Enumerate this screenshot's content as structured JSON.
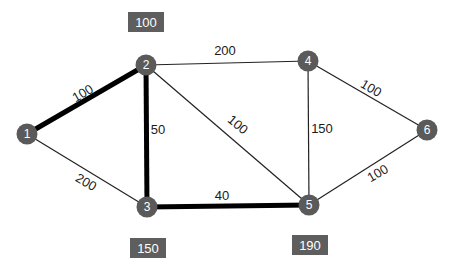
{
  "diagram": {
    "type": "weighted-graph",
    "colors": {
      "node_fill": "#5a5a5a",
      "node_text": "#ffffff",
      "edge_thin": "#222222",
      "edge_thick": "#000000",
      "distance_box": "#5e5e5e",
      "distance_text": "#ffffff",
      "edge_label": "#1a1a1a"
    },
    "nodes": [
      {
        "id": "1",
        "label": "1",
        "x": 27,
        "y": 134
      },
      {
        "id": "2",
        "label": "2",
        "x": 146,
        "y": 65
      },
      {
        "id": "3",
        "label": "3",
        "x": 147,
        "y": 207
      },
      {
        "id": "4",
        "label": "4",
        "x": 308,
        "y": 61
      },
      {
        "id": "5",
        "label": "5",
        "x": 309,
        "y": 205
      },
      {
        "id": "6",
        "label": "6",
        "x": 427,
        "y": 130
      }
    ],
    "edges": [
      {
        "from": "1",
        "to": "2",
        "weight": "100",
        "highlighted": true,
        "label_x": 85,
        "label_y": 97,
        "label_rotate": -30
      },
      {
        "from": "1",
        "to": "3",
        "weight": "200",
        "highlighted": false,
        "label_x": 84,
        "label_y": 186,
        "label_rotate": 30
      },
      {
        "from": "2",
        "to": "3",
        "weight": "50",
        "highlighted": true,
        "label_x": 158,
        "label_y": 134,
        "label_rotate": 0
      },
      {
        "from": "2",
        "to": "4",
        "weight": "200",
        "highlighted": false,
        "label_x": 225,
        "label_y": 55,
        "label_rotate": 0
      },
      {
        "from": "2",
        "to": "5",
        "weight": "100",
        "highlighted": false,
        "label_x": 235,
        "label_y": 128,
        "label_rotate": 40
      },
      {
        "from": "3",
        "to": "5",
        "weight": "40",
        "highlighted": true,
        "label_x": 222,
        "label_y": 200,
        "label_rotate": 0
      },
      {
        "from": "4",
        "to": "5",
        "weight": "150",
        "highlighted": false,
        "label_x": 322,
        "label_y": 133,
        "label_rotate": 0
      },
      {
        "from": "4",
        "to": "6",
        "weight": "100",
        "highlighted": false,
        "label_x": 369,
        "label_y": 92,
        "label_rotate": 30
      },
      {
        "from": "5",
        "to": "6",
        "weight": "100",
        "highlighted": false,
        "label_x": 380,
        "label_y": 177,
        "label_rotate": -30
      }
    ],
    "distance_boxes": [
      {
        "node": "2",
        "value": "100",
        "x": 128,
        "y": 12,
        "w": 36,
        "h": 20
      },
      {
        "node": "3",
        "value": "150",
        "x": 130,
        "y": 238,
        "w": 36,
        "h": 20
      },
      {
        "node": "5",
        "value": "190",
        "x": 292,
        "y": 235,
        "w": 36,
        "h": 20
      }
    ]
  }
}
